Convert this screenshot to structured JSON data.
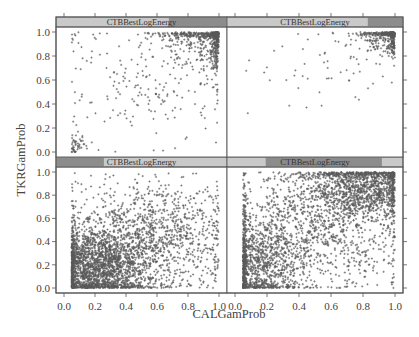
{
  "chart_data": {
    "type": "scatter",
    "layout": "2x2 lattice (trellis) panels, conditioned on CTBBestLogEnergy shingle",
    "xlabel": "CALGamProb",
    "ylabel": "TKRGamProb",
    "xlim": [
      0.0,
      1.0
    ],
    "ylim": [
      0.0,
      1.0
    ],
    "x_ticks": [
      "0.0",
      "0.2",
      "0.4",
      "0.6",
      "0.8",
      "1.0"
    ],
    "y_ticks": [
      "0.0",
      "0.2",
      "0.4",
      "0.6",
      "0.8",
      "1.0"
    ],
    "grid": false,
    "legend": null,
    "panels": [
      {
        "position": "bottom-left",
        "strip_label": "CTBBestLogEnergy",
        "strip_shade_range": [
          0.0,
          0.28
        ],
        "description": "Very dense cloud concentrated at low CALGamProb (0.05-0.5) and low TKRGamProb (0-0.5), thinning toward upper right",
        "n_points": 3200,
        "x_min": 0.05,
        "clusters": [
          {
            "weight": 0.62,
            "cx": 0.22,
            "cy": 0.18,
            "sx": 0.17,
            "sy": 0.17
          },
          {
            "weight": 0.38,
            "cx": 0.55,
            "cy": 0.45,
            "sx": 0.26,
            "sy": 0.24
          }
        ]
      },
      {
        "position": "bottom-right",
        "strip_label": "CTBBestLogEnergy",
        "strip_shade_range": [
          0.22,
          0.88
        ],
        "description": "Dense cloud spread across full range with concentrations at low-x/low-y and high-x/high-y corner",
        "n_points": 3400,
        "x_min": 0.05,
        "clusters": [
          {
            "weight": 0.3,
            "cx": 0.15,
            "cy": 0.2,
            "sx": 0.14,
            "sy": 0.18
          },
          {
            "weight": 0.35,
            "cx": 0.82,
            "cy": 0.88,
            "sx": 0.17,
            "sy": 0.14
          },
          {
            "weight": 0.35,
            "cx": 0.5,
            "cy": 0.55,
            "sx": 0.3,
            "sy": 0.28
          }
        ]
      },
      {
        "position": "top-left",
        "strip_label": "CTBBestLogEnergy",
        "strip_shade_range": [
          0.66,
          1.0
        ],
        "description": "Points concentrated in upper-right corner (CALGamProb>0.6, TKRGamProb>0.6), sparse scatter elsewhere; small cluster near (0.08, 0.05)",
        "n_points": 900,
        "x_min": 0.05,
        "clusters": [
          {
            "weight": 0.72,
            "cx": 0.97,
            "cy": 0.99,
            "sx": 0.16,
            "sy": 0.15
          },
          {
            "weight": 0.24,
            "cx": 0.55,
            "cy": 0.6,
            "sx": 0.3,
            "sy": 0.3
          },
          {
            "weight": 0.04,
            "cx": 0.08,
            "cy": 0.06,
            "sx": 0.03,
            "sy": 0.05
          }
        ]
      },
      {
        "position": "top-right",
        "strip_label": "CTBBestLogEnergy",
        "strip_shade_range": [
          0.8,
          1.0
        ],
        "description": "Very few points away from upper-right corner; dense block at CALGamProb>0.85, TKRGamProb>0.9",
        "n_points": 520,
        "x_min": 0.05,
        "clusters": [
          {
            "weight": 0.9,
            "cx": 0.98,
            "cy": 1.0,
            "sx": 0.1,
            "sy": 0.09
          },
          {
            "weight": 0.1,
            "cx": 0.55,
            "cy": 0.75,
            "sx": 0.25,
            "sy": 0.2
          }
        ]
      }
    ],
    "colors": {
      "points": "#5a5a5a",
      "frame": "#555555",
      "strip_light": "#c9c9c9",
      "strip_dark": "#8c8c8c",
      "text": "#444444"
    }
  },
  "labels": {
    "xlabel": "CALGamProb",
    "ylabel": "TKRGamProb",
    "strip": "CTBBestLogEnergy"
  }
}
